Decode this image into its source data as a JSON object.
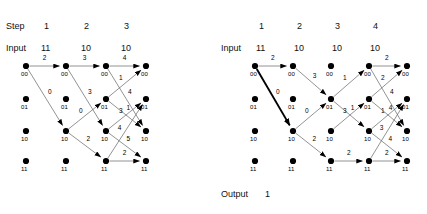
{
  "figure": {
    "title_hidden": "",
    "node_radius": 3.1,
    "colors": {
      "ink": "#000000",
      "edge": "#6f6f6f",
      "edge_survivor": "#000000",
      "background": "#ffffff"
    }
  },
  "left_panel": {
    "header": {
      "step_label": "Step",
      "input_label": "Input",
      "steps": [
        "1",
        "2",
        "3"
      ],
      "inputs": [
        "11",
        "10",
        "10"
      ]
    },
    "state_labels": [
      "00",
      "01",
      "10",
      "11"
    ],
    "columns": 4,
    "node_state_labels": [
      [
        "00",
        "01",
        "10",
        "11"
      ],
      [
        "00",
        "01",
        "10",
        "11"
      ],
      [
        "00",
        "01",
        "10",
        "11"
      ],
      [
        "00",
        "01",
        "10",
        "11"
      ]
    ],
    "edges": [
      {
        "from": [
          0,
          0
        ],
        "to": [
          1,
          0
        ],
        "label": "2",
        "survivor": false,
        "arrow": true
      },
      {
        "from": [
          0,
          0
        ],
        "to": [
          1,
          2
        ],
        "label": "0",
        "survivor": false,
        "arrow": true
      },
      {
        "from": [
          1,
          0
        ],
        "to": [
          2,
          0
        ],
        "label": "3",
        "survivor": false,
        "arrow": true
      },
      {
        "from": [
          1,
          0
        ],
        "to": [
          2,
          2
        ],
        "label": "3",
        "survivor": false,
        "arrow": true
      },
      {
        "from": [
          1,
          2
        ],
        "to": [
          2,
          1
        ],
        "label": "0",
        "survivor": false,
        "arrow": true
      },
      {
        "from": [
          1,
          2
        ],
        "to": [
          2,
          3
        ],
        "label": "2",
        "survivor": false,
        "arrow": true
      },
      {
        "from": [
          2,
          0
        ],
        "to": [
          3,
          0
        ],
        "label": "4",
        "survivor": false,
        "arrow": true
      },
      {
        "from": [
          2,
          0
        ],
        "to": [
          3,
          2
        ],
        "label": "4",
        "survivor": false,
        "arrow": true
      },
      {
        "from": [
          2,
          1
        ],
        "to": [
          3,
          0
        ],
        "label": "1",
        "survivor": false,
        "arrow": true
      },
      {
        "from": [
          2,
          1
        ],
        "to": [
          3,
          2
        ],
        "label": "1",
        "survivor": false,
        "arrow": true
      },
      {
        "from": [
          2,
          2
        ],
        "to": [
          3,
          1
        ],
        "label": "3",
        "survivor": false,
        "arrow": true
      },
      {
        "from": [
          2,
          2
        ],
        "to": [
          3,
          3
        ],
        "label": "5",
        "survivor": false,
        "arrow": true
      },
      {
        "from": [
          2,
          3
        ],
        "to": [
          3,
          3
        ],
        "label": "2",
        "survivor": false,
        "arrow": true
      },
      {
        "from": [
          2,
          3
        ],
        "to": [
          3,
          1
        ],
        "label": "4",
        "survivor": false,
        "arrow": true
      }
    ]
  },
  "right_panel": {
    "header": {
      "step_label": "",
      "input_label": "Input",
      "steps": [
        "1",
        "2",
        "3",
        "4"
      ],
      "inputs": [
        "11",
        "10",
        "10",
        "10"
      ]
    },
    "state_labels": [
      "00",
      "01",
      "10",
      "11"
    ],
    "columns": 5,
    "node_state_labels": [
      [
        "00",
        "01",
        "10",
        "11"
      ],
      [
        "00",
        "01",
        "10",
        "11"
      ],
      [
        "00",
        "01",
        "10",
        "11"
      ],
      [
        "00",
        "01",
        "10",
        "11"
      ],
      [
        "00",
        "01",
        "10",
        "11"
      ]
    ],
    "edges": [
      {
        "from": [
          0,
          0
        ],
        "to": [
          1,
          0
        ],
        "label": "2",
        "survivor": false,
        "arrow": true
      },
      {
        "from": [
          0,
          0
        ],
        "to": [
          1,
          2
        ],
        "label": "0",
        "survivor": true,
        "arrow": true
      },
      {
        "from": [
          1,
          0
        ],
        "to": [
          2,
          1
        ],
        "label": "3",
        "survivor": false,
        "arrow": true
      },
      {
        "from": [
          1,
          2
        ],
        "to": [
          2,
          1
        ],
        "label": "0",
        "survivor": false,
        "arrow": true
      },
      {
        "from": [
          1,
          2
        ],
        "to": [
          2,
          3
        ],
        "label": "2",
        "survivor": false,
        "arrow": true
      },
      {
        "from": [
          2,
          1
        ],
        "to": [
          3,
          0
        ],
        "label": "1",
        "survivor": false,
        "arrow": true
      },
      {
        "from": [
          2,
          1
        ],
        "to": [
          3,
          2
        ],
        "label": "1",
        "survivor": false,
        "arrow": true
      },
      {
        "from": [
          2,
          2
        ],
        "to": [
          3,
          1
        ],
        "label": "3",
        "survivor": false,
        "arrow": true
      },
      {
        "from": [
          2,
          3
        ],
        "to": [
          3,
          3
        ],
        "label": "2",
        "survivor": false,
        "arrow": true
      },
      {
        "from": [
          3,
          0
        ],
        "to": [
          4,
          0
        ],
        "label": "2",
        "survivor": false,
        "arrow": true
      },
      {
        "from": [
          3,
          0
        ],
        "to": [
          4,
          2
        ],
        "label": "4",
        "survivor": false,
        "arrow": true
      },
      {
        "from": [
          3,
          1
        ],
        "to": [
          4,
          0
        ],
        "label": "2",
        "survivor": false,
        "arrow": true
      },
      {
        "from": [
          3,
          1
        ],
        "to": [
          4,
          2
        ],
        "label": "4",
        "survivor": false,
        "arrow": true
      },
      {
        "from": [
          3,
          2
        ],
        "to": [
          4,
          1
        ],
        "label": "1",
        "survivor": false,
        "arrow": true
      },
      {
        "from": [
          3,
          2
        ],
        "to": [
          4,
          3
        ],
        "label": "4",
        "survivor": false,
        "arrow": true
      },
      {
        "from": [
          3,
          3
        ],
        "to": [
          4,
          3
        ],
        "label": "2",
        "survivor": false,
        "arrow": true
      },
      {
        "from": [
          3,
          3
        ],
        "to": [
          4,
          1
        ],
        "label": "3",
        "survivor": false,
        "arrow": true
      }
    ],
    "footer": {
      "output_label": "Output",
      "output_value": "1"
    }
  }
}
